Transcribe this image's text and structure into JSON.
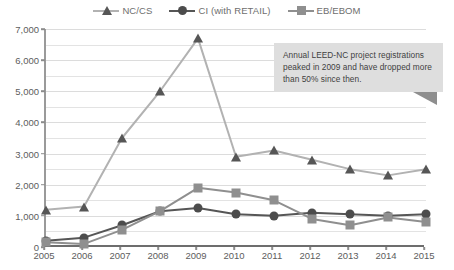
{
  "legend": {
    "position": "top-center",
    "entries": [
      {
        "label": "NC/CS",
        "marker": "triangle-icon",
        "color": "#565656"
      },
      {
        "label": "CI (with RETAIL)",
        "marker": "circle-icon",
        "color": "#4c4c4c"
      },
      {
        "label": "EB/EBOM",
        "marker": "square-icon",
        "color": "#8f8f8f"
      }
    ]
  },
  "callout": {
    "text": "Annual LEED-NC project registrations peaked in 2009 and have dropped more than 50% since then.",
    "background": "#dedede",
    "pointer": "triangle-pointer-icon"
  },
  "chart_data": {
    "type": "line",
    "title": "",
    "xlabel": "",
    "ylabel": "",
    "x": [
      2005,
      2006,
      2007,
      2008,
      2009,
      2010,
      2011,
      2012,
      2013,
      2014,
      2015
    ],
    "categories": [
      "2005",
      "2006",
      "2007",
      "2008",
      "2009",
      "2010",
      "2011",
      "2012",
      "2013",
      "2014",
      "2015"
    ],
    "ylim": [
      0,
      7000
    ],
    "yticks": [
      0,
      1000,
      2000,
      3000,
      4000,
      5000,
      6000,
      7000
    ],
    "ytick_labels": [
      "0",
      "1,000",
      "2,000",
      "3,000",
      "4,000",
      "5,000",
      "6,000",
      "7,000"
    ],
    "minor_gridlines": true,
    "grid": true,
    "legend_position": "top",
    "series": [
      {
        "name": "NC/CS",
        "marker": "triangle",
        "color": "#565656",
        "line_color": "#b2b2b2",
        "values": [
          1200,
          1300,
          3500,
          5000,
          6700,
          2900,
          3100,
          2800,
          2500,
          2300,
          2500
        ]
      },
      {
        "name": "CI (with RETAIL)",
        "marker": "circle",
        "color": "#4c4c4c",
        "line_color": "#565656",
        "values": [
          200,
          300,
          700,
          1150,
          1250,
          1050,
          1000,
          1100,
          1050,
          1000,
          1050
        ]
      },
      {
        "name": "EB/EBOM",
        "marker": "square",
        "color": "#8f8f8f",
        "line_color": "#8f8f8f",
        "values": [
          150,
          100,
          550,
          1150,
          1900,
          1750,
          1500,
          900,
          700,
          950,
          800
        ]
      }
    ]
  }
}
